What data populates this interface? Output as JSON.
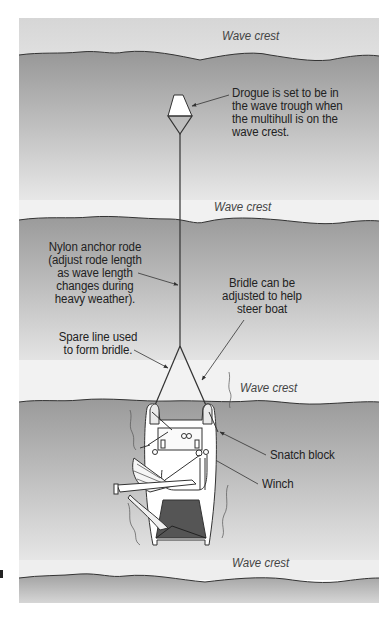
{
  "diagram": {
    "colors": {
      "sky_top": "#d9d9d9",
      "sky_bottom": "#f4f4f4",
      "sea_top": "#9a9a9a",
      "sea_bottom": "#ececec",
      "line": "#333333",
      "cockpit": "#555555"
    },
    "wave_labels": [
      "Wave crest",
      "Wave crest",
      "Wave crest",
      "Wave crest"
    ],
    "callouts": {
      "drogue": "Drogue is set to be in\nthe wave trough when\nthe multihull is on the\nwave crest.",
      "rode": "Nylon anchor rode\n(adjust rode length\nas wave length\nchanges during\nheavy weather).",
      "bridle_adjust": "Bridle can be\nadjusted to help\nsteer boat",
      "spare_line": "Spare line used\nto form bridle.",
      "snatch_block": "Snatch block",
      "winch": "Winch"
    }
  }
}
